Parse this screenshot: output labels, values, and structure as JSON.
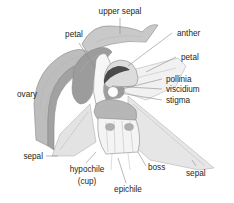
{
  "figure": {
    "kind": "botanical-diagram",
    "background_color": "#ffffff",
    "label_color": "#231f20",
    "leader_color": "#8c8c8c"
  },
  "labels": {
    "upper_sepal": "upper sepal",
    "petal_left": "petal",
    "anther": "anther",
    "petal_right": "petal",
    "pollinia": "pollinia",
    "viscidium": "viscidium",
    "stigma": "stigma",
    "ovary": "ovary",
    "sepal_left": "sepal",
    "hypochile": "hypochile",
    "hypochile_sub": "(cup)",
    "epichile": "epichile",
    "boss": "boss",
    "sepal_right": "sepal"
  },
  "parts": [
    {
      "name": "upper-sepal",
      "fill": "#c9c9c9"
    },
    {
      "name": "left-petal",
      "fill": "#9a9a9a"
    },
    {
      "name": "ovary",
      "fill": "#b0b0b0"
    },
    {
      "name": "left-sepal",
      "fill": "#e3e3e3"
    },
    {
      "name": "right-petal",
      "fill": "#f1f1f1"
    },
    {
      "name": "right-sepal",
      "fill": "#e6e6e6"
    },
    {
      "name": "column",
      "fill": "#f6f6f6"
    },
    {
      "name": "anther-cap",
      "fill": "#dcdcdc"
    },
    {
      "name": "pollinia",
      "fill": "#fbfbfb"
    },
    {
      "name": "viscidium",
      "fill": "#4a4a4a"
    },
    {
      "name": "stigma",
      "fill": "#6e6e6e"
    },
    {
      "name": "hypochile",
      "fill": "#b6b6b6"
    },
    {
      "name": "epichile",
      "fill": "#f4f4f4"
    },
    {
      "name": "boss",
      "fill": "#b3b3b3"
    }
  ]
}
